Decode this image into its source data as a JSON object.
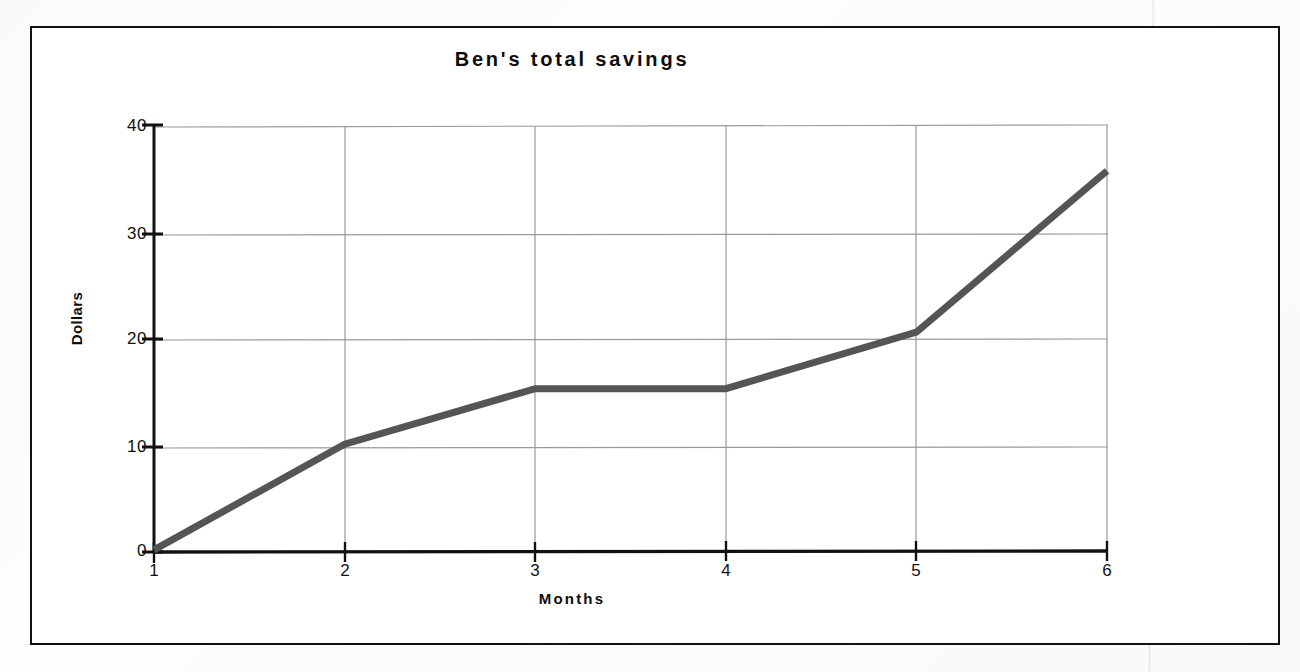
{
  "figure": {
    "background_color": "#ffffff",
    "frame_color": "#111111"
  },
  "chart_data": {
    "type": "line",
    "title": "Ben's total savings",
    "xlabel": "Months",
    "ylabel": "Dollars",
    "x": [
      1,
      2,
      3,
      4,
      5,
      6
    ],
    "values": [
      0.2,
      10.1,
      15.3,
      15.3,
      20.6,
      35.7
    ],
    "categories": [
      "1",
      "2",
      "3",
      "4",
      "5",
      "6"
    ],
    "xtick_labels": [
      "1",
      "2",
      "3",
      "4",
      "5",
      "6"
    ],
    "ytick_labels": [
      "0",
      "10",
      "20",
      "30",
      "40"
    ],
    "yticks": [
      0,
      10,
      20,
      30,
      40
    ],
    "xlim": [
      1,
      6
    ],
    "ylim": [
      0,
      40
    ],
    "grid": true,
    "grid_color": "#999999",
    "legend": null,
    "series": [
      {
        "name": "Total savings",
        "values": [
          0.2,
          10.1,
          15.3,
          15.3,
          20.6,
          35.7
        ],
        "color": "#555555",
        "line_width": 7,
        "marker": "none"
      }
    ],
    "annotations": []
  }
}
